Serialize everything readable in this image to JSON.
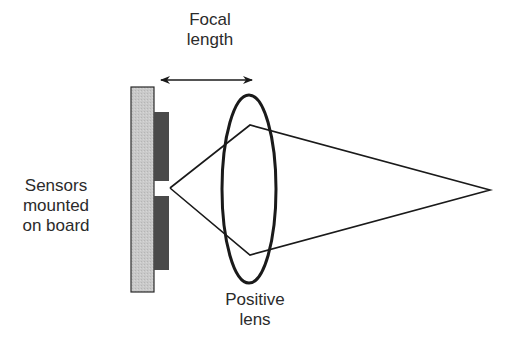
{
  "diagram": {
    "title": "",
    "labels": {
      "focal_length": [
        "Focal",
        "length"
      ],
      "sensors": [
        "Sensors",
        "mounted",
        "on board"
      ],
      "lens": [
        "Positive",
        "lens"
      ]
    },
    "colors": {
      "board_fill": "#c8c8c8",
      "sensor_fill": "#4a4a4a",
      "stroke": "#1a1a1a",
      "text": "#2b2b2b",
      "background": "#ffffff"
    },
    "elements": [
      {
        "id": "board",
        "type": "rect",
        "label": "Sensors mounted on board"
      },
      {
        "id": "sensor-upper",
        "type": "rect"
      },
      {
        "id": "sensor-lower",
        "type": "rect"
      },
      {
        "id": "lens",
        "type": "ellipse",
        "label": "Positive lens"
      },
      {
        "id": "focal-length-arrow",
        "type": "double-arrow",
        "label": "Focal length"
      },
      {
        "id": "ray-diagram",
        "type": "polyline",
        "description": "Rays from sensor gap diverge to lens edges and converge to a far point"
      }
    ]
  }
}
